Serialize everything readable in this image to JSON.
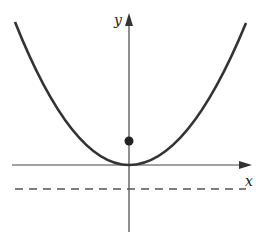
{
  "diagram": {
    "type": "parabola-focus-directrix",
    "axes": {
      "x_label": "x",
      "y_label": "y"
    },
    "curve": "parabola opening upward with vertex at origin",
    "focus": "point on y-axis above vertex",
    "directrix": "dashed horizontal line below x-axis",
    "colors": {
      "stroke": "#333333",
      "background": "#ffffff"
    }
  }
}
